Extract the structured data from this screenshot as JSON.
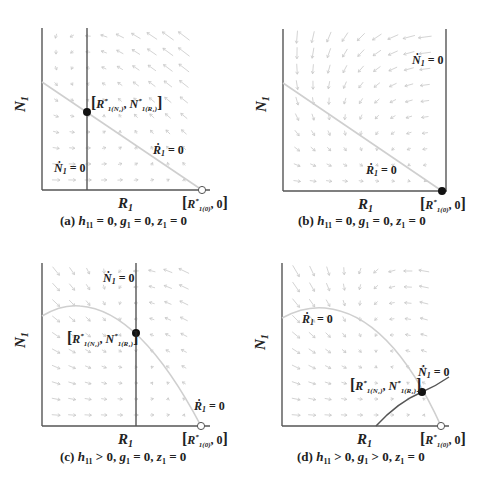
{
  "figure": {
    "panels": [
      {
        "id": "a",
        "caption_prefix": "(a) ",
        "caption_parts": [
          "h",
          "11",
          " = 0, ",
          "g",
          "1",
          " = 0, ",
          "z",
          "1",
          " = 0"
        ],
        "xlabel": "R",
        "xlabel_sub": "1",
        "ylabel": "N",
        "ylabel_sub": "1",
        "n_nullcline_label": "Ṅ₁ = 0",
        "r_nullcline_label": "Ṙ₁ = 0",
        "equilibrium_interior_label": "[R*1(N1), N*1(R1)]",
        "equilibrium_boundary_label": "[R*1(0), 0]",
        "interior_point": "stable (filled)",
        "boundary_point": "unstable (open)"
      },
      {
        "id": "b",
        "caption_prefix": "(b) ",
        "caption_parts": [
          "h",
          "11",
          " = 0, ",
          "g",
          "1",
          " = 0, ",
          "z",
          "1",
          " = 0"
        ],
        "xlabel": "R",
        "xlabel_sub": "1",
        "ylabel": "N",
        "ylabel_sub": "1",
        "n_nullcline_label": "Ṅ₁ = 0",
        "r_nullcline_label": "Ṙ₁ = 0",
        "equilibrium_boundary_label": "[R*1(0), 0]",
        "boundary_point": "stable (filled)"
      },
      {
        "id": "c",
        "caption_prefix": "(c) ",
        "caption_parts": [
          "h",
          "11",
          " > 0, ",
          "g",
          "1",
          " = 0, ",
          "z",
          "1",
          " = 0"
        ],
        "xlabel": "R",
        "xlabel_sub": "1",
        "ylabel": "N",
        "ylabel_sub": "1",
        "n_nullcline_label": "Ṅ₁ = 0",
        "r_nullcline_label": "Ṙ₁ = 0",
        "equilibrium_interior_label": "[R*1(N1), N*1(R1)]",
        "equilibrium_boundary_label": "[R*1(0), 0]",
        "interior_point": "stable (filled)",
        "boundary_point": "unstable (open)"
      },
      {
        "id": "d",
        "caption_prefix": "(d) ",
        "caption_parts": [
          "h",
          "11",
          " > 0, ",
          "g",
          "1",
          " > 0, ",
          "z",
          "1",
          " = 0"
        ],
        "xlabel": "R",
        "xlabel_sub": "1",
        "ylabel": "N",
        "ylabel_sub": "1",
        "n_nullcline_label": "Ṅ₁ = 0",
        "r_nullcline_label": "Ṙ₁ = 0",
        "equilibrium_interior_label": "[R*1(N1), N*1(R1)]",
        "equilibrium_boundary_label": "[R*1(0), 0]",
        "interior_point": "stable (filled)",
        "boundary_point": "unstable (open)"
      }
    ],
    "colors": {
      "axis": "#555555",
      "n_nullcline": "#555555",
      "r_nullcline": "#cfcfcf",
      "vector_field": "#c8c8c8",
      "text": "#222222"
    }
  }
}
